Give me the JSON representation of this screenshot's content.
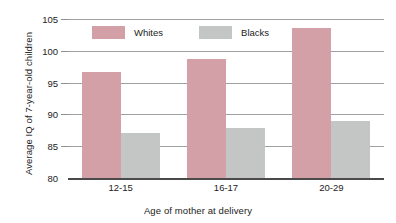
{
  "chart_data": {
    "type": "bar",
    "title": "",
    "subtitle": "",
    "xlabel": "Age of mother at delivery",
    "ylabel": "Average IQ of 7-year-old children",
    "categories": [
      "12-15",
      "16-17",
      "20-29"
    ],
    "series": [
      {
        "name": "Whites",
        "color": "#d3a0a8",
        "values": [
          96.6,
          98.7,
          103.6
        ]
      },
      {
        "name": "Blacks",
        "color": "#c4c5c5",
        "values": [
          87.1,
          87.8,
          88.9
        ]
      }
    ],
    "ylim": [
      80,
      105
    ],
    "yticks": [
      80,
      85,
      90,
      95,
      100,
      105
    ],
    "ytick_labels": [
      "80",
      "85",
      "90",
      "95",
      "100",
      "105"
    ],
    "grid": "horizontal",
    "legend_position": "top-center",
    "legend_entries": [
      "Whites",
      "Blacks"
    ]
  },
  "axes": {
    "y_title": "Average IQ of 7-year-old children",
    "x_title": "Age of mother at delivery",
    "y_ticks": [
      {
        "label": "105",
        "value": 105
      },
      {
        "label": "100",
        "value": 100
      },
      {
        "label": "95",
        "value": 95
      },
      {
        "label": "90",
        "value": 90
      },
      {
        "label": "85",
        "value": 85
      },
      {
        "label": "80",
        "value": 80
      }
    ],
    "x_ticks": [
      {
        "label": "12-15"
      },
      {
        "label": "16-17"
      },
      {
        "label": "20-29"
      }
    ]
  },
  "legend": {
    "items": [
      {
        "label": "Whites",
        "color": "#d3a0a8"
      },
      {
        "label": "Blacks",
        "color": "#c4c5c5"
      }
    ]
  }
}
